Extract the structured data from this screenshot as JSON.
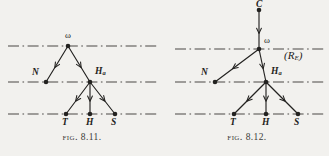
{
  "page": {
    "background_color": "#f2f1ee",
    "ink_color": "#232220",
    "line_color": "#4a4845",
    "width": 329,
    "height": 156
  },
  "figures": [
    {
      "id": "fig-8-11",
      "caption_prefix": "Fig.",
      "caption_number": "8.11.",
      "caption_full": "Fig. 8.11.",
      "levels": [
        {
          "name": "upper-level-line",
          "y": 46
        },
        {
          "name": "middle-level-line",
          "y": 82
        },
        {
          "name": "lower-level-line",
          "y": 114
        }
      ],
      "nodes": [
        {
          "id": "omega",
          "label": "ω",
          "x": 68,
          "y": 46,
          "label_dx": -3,
          "label_dy": -13
        },
        {
          "id": "N",
          "label": "N",
          "x": 46,
          "y": 82,
          "label_dx": -14,
          "label_dy": -12
        },
        {
          "id": "Ha",
          "label": "H",
          "sub": "a",
          "x": 90,
          "y": 82,
          "label_dx": 5,
          "label_dy": -13
        },
        {
          "id": "T",
          "label": "T",
          "x": 66,
          "y": 114,
          "label_dx": -3,
          "label_dy": 6
        },
        {
          "id": "H",
          "label": "H",
          "x": 90,
          "y": 114,
          "label_dx": -3,
          "label_dy": 6
        },
        {
          "id": "S",
          "label": "S",
          "x": 115,
          "y": 114,
          "label_dx": -3,
          "label_dy": 6
        }
      ],
      "arrows": [
        {
          "from": "omega",
          "to": "N",
          "name": "arrow-omega-to-N"
        },
        {
          "from": "omega",
          "to": "Ha",
          "name": "arrow-omega-to-Ha"
        },
        {
          "from": "Ha",
          "to": "T",
          "name": "arrow-Ha-to-T"
        },
        {
          "from": "Ha",
          "to": "H",
          "name": "arrow-Ha-to-H"
        },
        {
          "from": "Ha",
          "to": "S",
          "name": "arrow-Ha-to-S"
        }
      ],
      "annotations": []
    },
    {
      "id": "fig-8-12",
      "caption_prefix": "Fig.",
      "caption_number": "8.12.",
      "caption_full": "Fig. 8.12.",
      "levels": [
        {
          "name": "upper-level-line",
          "y": 49
        },
        {
          "name": "middle-level-line",
          "y": 82
        },
        {
          "name": "lower-level-line",
          "y": 114
        }
      ],
      "nodes": [
        {
          "id": "C",
          "label": "C",
          "x": 94,
          "y": 10,
          "label_dx": -3,
          "label_dy": -13
        },
        {
          "id": "omega",
          "label": "ω",
          "x": 94,
          "y": 49,
          "label_dx": 5,
          "label_dy": -12
        },
        {
          "id": "N",
          "label": "N",
          "x": 50,
          "y": 82,
          "label_dx": -14,
          "label_dy": -12
        },
        {
          "id": "Ha",
          "label": "H",
          "sub": "a",
          "x": 101,
          "y": 82,
          "label_dx": 5,
          "label_dy": -13
        },
        {
          "id": "T",
          "label": "T",
          "x": 69,
          "y": 114,
          "label_dx": -3,
          "label_dy": 6
        },
        {
          "id": "H",
          "label": "H",
          "x": 101,
          "y": 114,
          "label_dx": -3,
          "label_dy": 6
        },
        {
          "id": "S",
          "label": "S",
          "x": 133,
          "y": 114,
          "label_dx": -3,
          "label_dy": 6
        }
      ],
      "arrows": [
        {
          "from": "C",
          "to": "omega",
          "name": "arrow-C-to-omega"
        },
        {
          "from": "omega",
          "to": "N",
          "name": "arrow-omega-to-N"
        },
        {
          "from": "omega",
          "to": "Ha",
          "name": "arrow-omega-to-Ha"
        },
        {
          "from": "Ha",
          "to": "T",
          "name": "arrow-Ha-to-T"
        },
        {
          "from": "Ha",
          "to": "H",
          "name": "arrow-Ha-to-H"
        },
        {
          "from": "Ha",
          "to": "S",
          "name": "arrow-Ha-to-S"
        }
      ],
      "annotations": [
        {
          "id": "region-label",
          "label": "(R",
          "sub": "E",
          "label_end": ")",
          "x": 122,
          "y": 57
        }
      ]
    }
  ]
}
